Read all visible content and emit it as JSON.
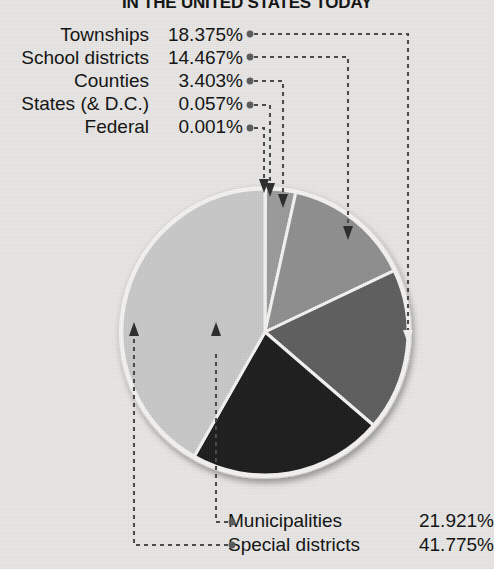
{
  "title": "IN THE UNITED STATES TODAY",
  "background_color": "#e8e7e5",
  "left_labels": [
    {
      "name": "Townships",
      "percent": "18.375%"
    },
    {
      "name": "School districts",
      "percent": "14.467%"
    },
    {
      "name": "Counties",
      "percent": "3.403%"
    },
    {
      "name": "States (& D.C.)",
      "percent": "0.057%"
    },
    {
      "name": "Federal",
      "percent": "0.001%"
    }
  ],
  "bottom_labels": [
    {
      "name": "Municipalities",
      "percent": "21.921%"
    },
    {
      "name": "Special districts",
      "percent": "41.775%"
    }
  ],
  "chart_data": {
    "type": "pie",
    "title": "IN THE UNITED STATES TODAY",
    "categories": [
      "Federal",
      "States (& D.C.)",
      "Counties",
      "School districts",
      "Townships",
      "Municipalities",
      "Special districts"
    ],
    "values": [
      0.001,
      0.057,
      3.403,
      14.467,
      18.375,
      21.921,
      41.775
    ],
    "unit": "%",
    "labels": [
      "0.001%",
      "0.057%",
      "3.403%",
      "14.467%",
      "18.375%",
      "21.921%",
      "41.775%"
    ],
    "colors": [
      "#8a8a8a",
      "#8a8a8a",
      "#9b9b9b",
      "#8f8f8f",
      "#5e5e5e",
      "#1d1d1d",
      "#c9c9c9"
    ],
    "start_angle_deg": 0,
    "direction": "clockwise",
    "slice_border_color": "#f4f3f1",
    "legend": "leader-lines",
    "grid": false
  }
}
